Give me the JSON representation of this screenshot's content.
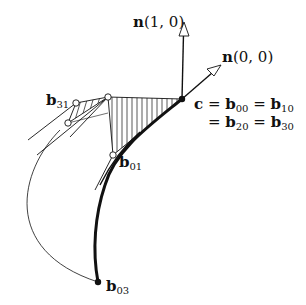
{
  "diagram": {
    "colors": {
      "ink": "#111111",
      "background": "#ffffff"
    },
    "labels": {
      "n10": {
        "bold": "n",
        "rest": "(1, 0)"
      },
      "n00": {
        "bold": "n",
        "rest": "(0, 0)"
      },
      "c_line1": {
        "c": "c",
        "eq1": " = ",
        "b": "b",
        "sub1": "00",
        "eq2": " = ",
        "b2": "b",
        "sub2": "10"
      },
      "c_line2": {
        "eq1": "= ",
        "b": "b",
        "sub1": "20",
        "eq2": " = ",
        "b2": "b",
        "sub2": "30"
      },
      "b01": {
        "b": "b",
        "sub": "01"
      },
      "b31": {
        "b": "b",
        "sub": "31"
      },
      "b03": {
        "b": "b",
        "sub": "03"
      }
    },
    "points": [
      {
        "name": "c",
        "x": 182,
        "y": 99,
        "style": "filled"
      },
      {
        "name": "b01",
        "x": 113,
        "y": 155,
        "style": "open"
      },
      {
        "name": "top-control",
        "x": 108,
        "y": 97,
        "style": "open"
      },
      {
        "name": "b31",
        "x": 76,
        "y": 103,
        "style": "open"
      },
      {
        "name": "inner-control",
        "x": 68,
        "y": 123,
        "style": "open"
      },
      {
        "name": "b03",
        "x": 98,
        "y": 282,
        "style": "filled"
      }
    ],
    "arrows": [
      {
        "name": "n(1,0)",
        "from": [
          182,
          99
        ],
        "to": [
          184,
          22
        ]
      },
      {
        "name": "n(0,0)",
        "from": [
          182,
          99
        ],
        "to": [
          221,
          65
        ]
      }
    ]
  }
}
